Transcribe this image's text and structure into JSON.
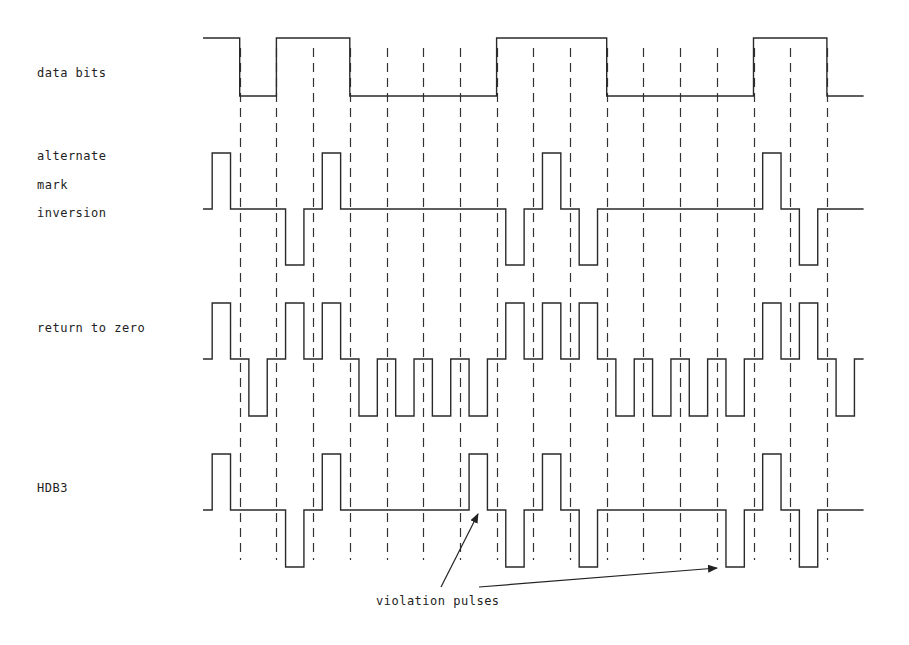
{
  "labels": {
    "data_bits": "data bits",
    "ami_line1": "alternate",
    "ami_line2": "mark",
    "ami_line3": "inversion",
    "rz": "return to zero",
    "hdb3": "HDB3",
    "annotation": "violation pulses"
  },
  "timing": {
    "x_start": 203,
    "bit_width": 36.7,
    "num_bits": 18,
    "pulse_width_fraction": 0.5,
    "grid_top": 48,
    "grid_bottom": 560
  },
  "signals": {
    "data_bits": {
      "type": "nrz",
      "high_y": 38,
      "low_y": 96,
      "values": [
        1,
        0,
        1,
        1,
        0,
        0,
        0,
        0,
        1,
        1,
        1,
        0,
        0,
        0,
        0,
        1,
        1,
        0
      ]
    },
    "ami": {
      "type": "rz_ternary",
      "zero_y": 209,
      "pos_y": 153,
      "neg_y": 265,
      "values": [
        1,
        0,
        -1,
        1,
        0,
        0,
        0,
        0,
        -1,
        1,
        -1,
        0,
        0,
        0,
        0,
        1,
        -1,
        0
      ]
    },
    "rz": {
      "type": "rz_ternary",
      "zero_y": 359,
      "pos_y": 303,
      "neg_y": 416,
      "values": [
        1,
        -1,
        1,
        1,
        -1,
        -1,
        -1,
        -1,
        1,
        1,
        1,
        -1,
        -1,
        -1,
        -1,
        1,
        1,
        -1
      ]
    },
    "hdb3": {
      "type": "rz_ternary",
      "zero_y": 510,
      "pos_y": 454,
      "neg_y": 567,
      "values": [
        1,
        0,
        -1,
        1,
        0,
        0,
        0,
        1,
        -1,
        1,
        -1,
        0,
        0,
        0,
        -1,
        1,
        -1,
        0
      ],
      "violation_bit_indices": [
        7,
        14
      ]
    }
  },
  "arrows": [
    {
      "from": [
        441,
        587
      ],
      "to": [
        478,
        514
      ]
    },
    {
      "from": [
        479,
        587
      ],
      "to": [
        717,
        568
      ]
    }
  ],
  "colors": {
    "ink": "#2a2a2a",
    "background": "#ffffff"
  }
}
